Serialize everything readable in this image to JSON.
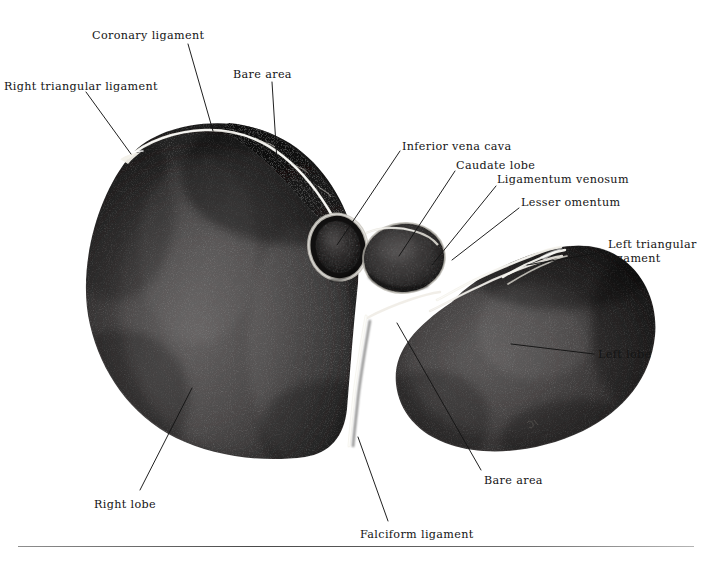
{
  "figure": {
    "background_color": "#ffffff",
    "organ_fill_color": "#3a3a3a",
    "bare_area_color": "#0d0d0d",
    "ligament_highlight_color": "#f2f0ea",
    "leader_line_color": "#141414",
    "artist_mark": "⌁"
  },
  "labels": [
    {
      "id": "right-triangular-ligament",
      "text": "Right triangular ligament",
      "x": 4,
      "y": 80,
      "lines": 1
    },
    {
      "id": "coronary-ligament",
      "text": "Coronary ligament",
      "x": 92,
      "y": 29,
      "lines": 1
    },
    {
      "id": "bare-area-top",
      "text": "Bare area",
      "x": 233,
      "y": 68,
      "lines": 1
    },
    {
      "id": "inferior-vena-cava",
      "text": "Inferior vena cava",
      "x": 402,
      "y": 140,
      "lines": 1
    },
    {
      "id": "caudate-lobe",
      "text": "Caudate lobe",
      "x": 456,
      "y": 159,
      "lines": 1
    },
    {
      "id": "ligamentum-venosum",
      "text": "Ligamentum venosum",
      "x": 497,
      "y": 173,
      "lines": 1
    },
    {
      "id": "lesser-omentum",
      "text": "Lesser omentum",
      "x": 521,
      "y": 196,
      "lines": 1
    },
    {
      "id": "left-triangular-ligament",
      "text": "Left triangular ligament",
      "x": 608,
      "y": 238,
      "lines": 2
    },
    {
      "id": "left-lobe",
      "text": "Left lobe",
      "x": 598,
      "y": 348,
      "lines": 1
    },
    {
      "id": "bare-area-bottom",
      "text": "Bare area",
      "x": 484,
      "y": 474,
      "lines": 1
    },
    {
      "id": "right-lobe",
      "text": "Right lobe",
      "x": 94,
      "y": 498,
      "lines": 1
    },
    {
      "id": "falciform-ligament",
      "text": "Falciform ligament",
      "x": 360,
      "y": 528,
      "lines": 1
    }
  ],
  "structures": [
    {
      "id": "right-lobe",
      "name": "Right lobe"
    },
    {
      "id": "left-lobe",
      "name": "Left lobe"
    },
    {
      "id": "caudate-lobe",
      "name": "Caudate lobe"
    },
    {
      "id": "inferior-vena-cava",
      "name": "Inferior vena cava"
    },
    {
      "id": "bare-area",
      "name": "Bare area"
    },
    {
      "id": "coronary-ligament",
      "name": "Coronary ligament"
    },
    {
      "id": "right-triangular-ligament",
      "name": "Right triangular ligament"
    },
    {
      "id": "left-triangular-ligament",
      "name": "Left triangular ligament"
    },
    {
      "id": "ligamentum-venosum",
      "name": "Ligamentum venosum"
    },
    {
      "id": "lesser-omentum",
      "name": "Lesser omentum"
    },
    {
      "id": "falciform-ligament",
      "name": "Falciform ligament"
    }
  ]
}
